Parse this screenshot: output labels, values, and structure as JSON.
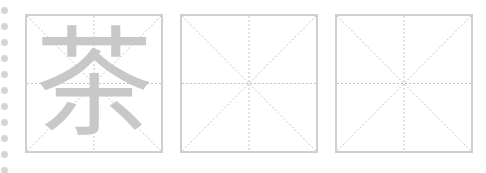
{
  "sheet": {
    "type": "mi-zi-ge practice grid",
    "binding_dots": 11,
    "grid_color": "#cfcfcf",
    "guide_color": "#c8c8c8",
    "cells": [
      {
        "character": "茶",
        "style": "trace"
      },
      {
        "character": "",
        "style": "empty"
      },
      {
        "character": "",
        "style": "empty"
      }
    ]
  }
}
